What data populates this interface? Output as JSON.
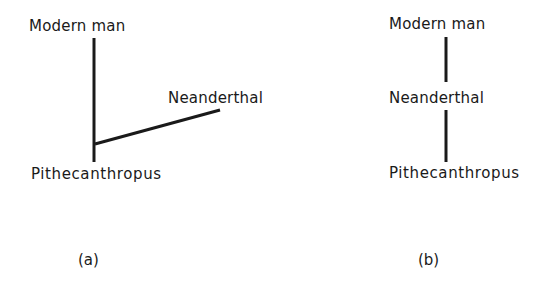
{
  "diagram_a": {
    "caption": "(a)",
    "nodes": {
      "top": "Modern man",
      "branch": "Neanderthal",
      "base": "Pithecanthropus"
    },
    "description": "Modern man and Neanderthal both descend separately from Pithecanthropus; Neanderthal is a side branch"
  },
  "diagram_b": {
    "caption": "(b)",
    "nodes": {
      "top": "Modern man",
      "middle": "Neanderthal",
      "base": "Pithecanthropus"
    },
    "description": "Linear sequence: Pithecanthropus to Neanderthal to Modern man"
  },
  "line_color": "#1a1a1a"
}
